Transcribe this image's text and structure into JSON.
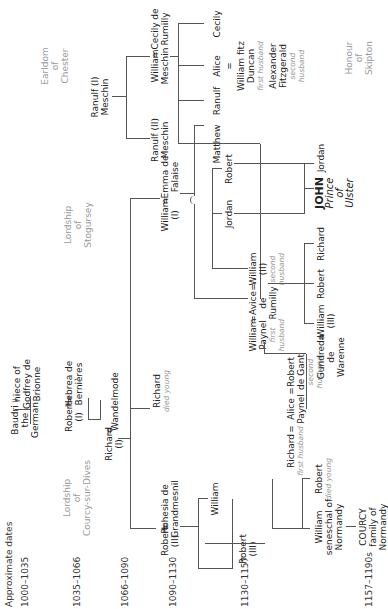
{
  "dates": {
    "label": "Approximate dates",
    "periods": [
      "1000–1035",
      "1035–1066",
      "1066–1090",
      "1090–1130",
      "1130–1157",
      "1157–1190s"
    ]
  },
  "lordships": {
    "courcy": [
      "Lordship",
      "of",
      "Courcy-sur-Dives"
    ],
    "stogursey": [
      "Lordship",
      "of",
      "Stogursey"
    ],
    "chester": [
      "Earldom",
      "of",
      "Chester"
    ],
    "skipton": [
      "Honour",
      "of",
      "Skipton"
    ]
  },
  "people": {
    "baudri": [
      "Baudri",
      "the",
      "German"
    ],
    "niece_godfrey": [
      "niece of",
      "Godfrey de",
      "Brionne"
    ],
    "robert_i": [
      "Robert",
      "(I)"
    ],
    "hebrea": [
      "Hebrea de",
      "Bernières"
    ],
    "richard_i": [
      "Richard",
      "(I)"
    ],
    "wandelmode": "Wandelmode",
    "robert_ii": [
      "Robert",
      "(II)"
    ],
    "rohesia": [
      "Rohesia de",
      "Grandmesnil"
    ],
    "richard_died": "Richard",
    "richard_died_note": "died young",
    "william_i": [
      "William",
      "(I)"
    ],
    "emma": [
      "Emma de",
      "Falaise"
    ],
    "ranulf_i": [
      "Ranulf (I)",
      "Meschin"
    ],
    "ranulf_ii": [
      "Ranulf (II)",
      "Meschin"
    ],
    "william_meschin": [
      "William",
      "Meschin"
    ],
    "cecily_rumilly": [
      "Cecily de",
      "Rumilly"
    ],
    "robert_iii": [
      "Robert",
      "(III)"
    ],
    "william_sibling": "William",
    "richard_fh": "Richard",
    "richard_fh_note": "first husband",
    "alice_paynel": [
      "Alice",
      "Paynel"
    ],
    "robert_de_gant": [
      "Robert",
      "de Gant"
    ],
    "robert_de_gant_note": [
      "second",
      "husband"
    ],
    "william_paynel": [
      "William",
      "Paynel"
    ],
    "william_paynel_note": [
      "first",
      "husband"
    ],
    "avice": [
      "Avice",
      "de",
      "Rumilly"
    ],
    "william_ii": [
      "William",
      "(II)"
    ],
    "william_ii_note": [
      "second",
      "husband"
    ],
    "jordan_1": "Jordan",
    "robert_emma": "Robert",
    "matthew": "Matthew",
    "ranulf_child": "Ranulf",
    "alice_child": "Alice",
    "cecily_child": "Cecily",
    "wm_fitz_duncan": [
      "William fitz",
      "Duncan"
    ],
    "wm_fitz_duncan_note": "first husband",
    "alexander": [
      "Alexander",
      "Fitzgerald"
    ],
    "alexander_note": [
      "second",
      "husband"
    ],
    "william_seneschal": [
      "William",
      "seneschal of",
      "Normandy"
    ],
    "robert_died": "Robert",
    "robert_died_note": "died young",
    "courcy_family": [
      "COURCY",
      "family of",
      "Normandy"
    ],
    "gundreda": [
      "Gundreda",
      "de",
      "Warenne"
    ],
    "william_iii": [
      "William",
      "(III)"
    ],
    "robert_g": "Robert",
    "richard_g": "Richard",
    "john": "JOHN",
    "john_title": [
      "Prince",
      "of",
      "Ulster"
    ],
    "jordan_2": "Jordan"
  },
  "symbols": {
    "marriage": "="
  }
}
